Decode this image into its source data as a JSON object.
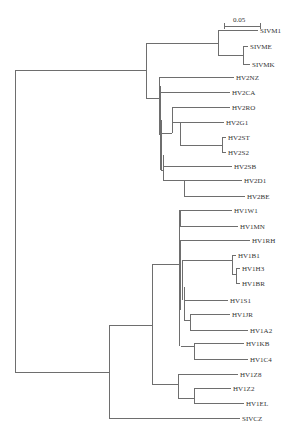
{
  "figure": {
    "type": "phylogenetic-tree",
    "scale_bar": {
      "label": "0.05"
    }
  },
  "leaves": [
    {
      "id": "SIVM1"
    },
    {
      "id": "SIVME"
    },
    {
      "id": "SIVMK"
    },
    {
      "id": "HV2NZ"
    },
    {
      "id": "HV2CA"
    },
    {
      "id": "HV2RO"
    },
    {
      "id": "HV2G1"
    },
    {
      "id": "HV2ST"
    },
    {
      "id": "HV2S2"
    },
    {
      "id": "HV2SB"
    },
    {
      "id": "HV2D1"
    },
    {
      "id": "HV2BE"
    },
    {
      "id": "HV1W1"
    },
    {
      "id": "HV1MN"
    },
    {
      "id": "HV1RH"
    },
    {
      "id": "HV1B1"
    },
    {
      "id": "HV1H3"
    },
    {
      "id": "HV1BR"
    },
    {
      "id": "HV1S1"
    },
    {
      "id": "HV1JR"
    },
    {
      "id": "HV1A2"
    },
    {
      "id": "HV1KB"
    },
    {
      "id": "HV1C4"
    },
    {
      "id": "HV1Z8"
    },
    {
      "id": "HV1Z2"
    },
    {
      "id": "HV1EL"
    },
    {
      "id": "SIVCZ"
    }
  ]
}
